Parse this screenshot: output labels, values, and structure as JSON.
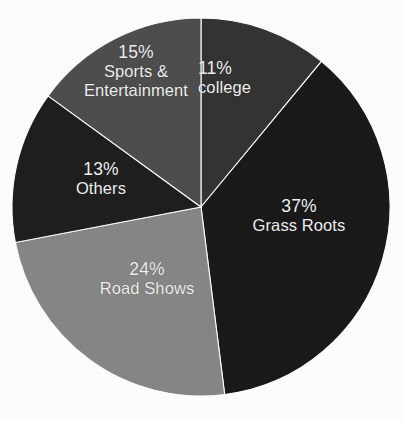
{
  "chart_data": {
    "type": "pie",
    "title": "",
    "subtitle": "",
    "xlabel": "",
    "ylabel": "",
    "legend_position": "none",
    "grid": false,
    "labels_inside_slices": true,
    "start_angle_deg": 0,
    "direction": "clockwise",
    "value_unit": "percent",
    "categories": [
      "college",
      "Grass Roots",
      "Road Shows",
      "Others",
      "Sports & Entertainment"
    ],
    "values": [
      11,
      37,
      24,
      13,
      15
    ],
    "colors": [
      "#343434",
      "#1a1a1a",
      "#878787",
      "#1f1f1f",
      "#4e4e4e"
    ],
    "slices": [
      {
        "name": "college",
        "percent_label": "11%",
        "value": 11,
        "color": "#343434",
        "label_lines": [
          "college"
        ],
        "start_angle_deg": 0.0,
        "end_angle_deg": 39.6
      },
      {
        "name": "Grass Roots",
        "percent_label": "37%",
        "value": 37,
        "color": "#1a1a1a",
        "label_lines": [
          "Grass Roots"
        ],
        "start_angle_deg": 39.6,
        "end_angle_deg": 172.8
      },
      {
        "name": "Road Shows",
        "percent_label": "24%",
        "value": 24,
        "color": "#878787",
        "label_lines": [
          "Road Shows"
        ],
        "start_angle_deg": 172.8,
        "end_angle_deg": 259.2
      },
      {
        "name": "Others",
        "percent_label": "13%",
        "value": 13,
        "color": "#1f1f1f",
        "label_lines": [
          "Others"
        ],
        "start_angle_deg": 259.2,
        "end_angle_deg": 306.0
      },
      {
        "name": "Sports & Entertainment",
        "percent_label": "15%",
        "value": 15,
        "color": "#4e4e4e",
        "label_lines": [
          "Sports &",
          "Entertainment"
        ],
        "start_angle_deg": 306.0,
        "end_angle_deg": 360.0
      }
    ],
    "geometry": {
      "center_x": 201,
      "center_y": 207,
      "radius": 189
    },
    "background_color": "#ffffff",
    "label_text_color": "#f2f2f2"
  }
}
